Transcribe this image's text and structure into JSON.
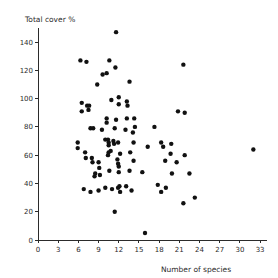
{
  "chart_data": {
    "type": "scatter",
    "title": "",
    "xlabel": "Number of species",
    "ylabel": "Total cover  %",
    "xlim": [
      0,
      34
    ],
    "ylim": [
      0,
      150
    ],
    "xticks": [
      0,
      3,
      6,
      9,
      12,
      15,
      18,
      21,
      24,
      27,
      30,
      33
    ],
    "xtick_labels": [
      "0",
      "3",
      "6",
      "9",
      "12",
      "15",
      "18",
      "21",
      "24",
      "27",
      "30",
      "33"
    ],
    "yticks": [
      0,
      20,
      40,
      60,
      80,
      100,
      120,
      140
    ],
    "ytick_labels": [
      "0",
      "20",
      "40",
      "60",
      "80",
      "100",
      "120",
      "140"
    ],
    "grid": false,
    "legend": null,
    "marker": "filled-circle",
    "marker_color": "#111111",
    "marker_size_px": 3.4,
    "n_points": 94,
    "points": [
      [
        11.6,
        147
      ],
      [
        6.3,
        127
      ],
      [
        7.2,
        126
      ],
      [
        10.6,
        127
      ],
      [
        11.5,
        122
      ],
      [
        9.6,
        117
      ],
      [
        10.2,
        118
      ],
      [
        8.8,
        110
      ],
      [
        21.6,
        124
      ],
      [
        13.6,
        112
      ],
      [
        6.5,
        97
      ],
      [
        7.3,
        95
      ],
      [
        6.5,
        91
      ],
      [
        7.5,
        92
      ],
      [
        7.6,
        95
      ],
      [
        10.9,
        99
      ],
      [
        12.0,
        96
      ],
      [
        13.2,
        98
      ],
      [
        13.3,
        95
      ],
      [
        12.0,
        101
      ],
      [
        20.8,
        91
      ],
      [
        21.8,
        90
      ],
      [
        10.2,
        86
      ],
      [
        10.2,
        83
      ],
      [
        11.6,
        85
      ],
      [
        13.2,
        86
      ],
      [
        14.3,
        86
      ],
      [
        7.8,
        79
      ],
      [
        8.2,
        79
      ],
      [
        9.5,
        78
      ],
      [
        11.4,
        79
      ],
      [
        13.0,
        78
      ],
      [
        14.1,
        76
      ],
      [
        14.4,
        80
      ],
      [
        17.3,
        80
      ],
      [
        5.9,
        69
      ],
      [
        5.9,
        65
      ],
      [
        10.0,
        71
      ],
      [
        10.4,
        71
      ],
      [
        10.5,
        69
      ],
      [
        10.5,
        67
      ],
      [
        11.2,
        70
      ],
      [
        11.3,
        68
      ],
      [
        11.9,
        69
      ],
      [
        14.2,
        69
      ],
      [
        16.3,
        66
      ],
      [
        18.3,
        69
      ],
      [
        18.6,
        66
      ],
      [
        19.8,
        68
      ],
      [
        32.0,
        64
      ],
      [
        7.0,
        62
      ],
      [
        7.1,
        58
      ],
      [
        8.0,
        58
      ],
      [
        8.1,
        55
      ],
      [
        10.4,
        60
      ],
      [
        10.5,
        62
      ],
      [
        12.2,
        61
      ],
      [
        13.7,
        62
      ],
      [
        19.7,
        61
      ],
      [
        21.8,
        60
      ],
      [
        9.0,
        55
      ],
      [
        9.1,
        51
      ],
      [
        11.8,
        57
      ],
      [
        11.9,
        54
      ],
      [
        12.0,
        52
      ],
      [
        14.2,
        56
      ],
      [
        18.9,
        56
      ],
      [
        20.6,
        55
      ],
      [
        10.6,
        49
      ],
      [
        12.0,
        48
      ],
      [
        13.6,
        49
      ],
      [
        15.5,
        48
      ],
      [
        19.9,
        47
      ],
      [
        22.5,
        47
      ],
      [
        8.4,
        45
      ],
      [
        8.5,
        47
      ],
      [
        9.2,
        46
      ],
      [
        17.8,
        39
      ],
      [
        10.0,
        37
      ],
      [
        11.0,
        36
      ],
      [
        11.9,
        37
      ],
      [
        13.1,
        38
      ],
      [
        19.0,
        37
      ],
      [
        6.8,
        36
      ],
      [
        7.8,
        34
      ],
      [
        9.0,
        35
      ],
      [
        13.9,
        35
      ],
      [
        18.3,
        34
      ],
      [
        23.3,
        30
      ],
      [
        21.6,
        26
      ],
      [
        11.4,
        20
      ],
      [
        15.9,
        5
      ],
      [
        12.1,
        38
      ],
      [
        12.2,
        34
      ],
      [
        10.8,
        63
      ]
    ]
  },
  "layout": {
    "plot_left_px": 38,
    "plot_bottom_px": 240,
    "x_px_per_unit": 6.73,
    "y_px_per_unit": 1.414
  }
}
